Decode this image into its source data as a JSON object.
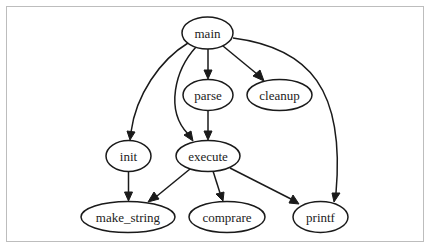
{
  "diagram": {
    "type": "directed-call-graph",
    "nodes": [
      {
        "id": "main",
        "label": "main",
        "cx": 207.5,
        "cy": 33,
        "rx": 25.5,
        "ry": 16
      },
      {
        "id": "parse",
        "label": "parse",
        "cx": 208,
        "cy": 95,
        "rx": 25,
        "ry": 15.5
      },
      {
        "id": "cleanup",
        "label": "cleanup",
        "cx": 279.5,
        "cy": 95,
        "rx": 32.5,
        "ry": 15.5
      },
      {
        "id": "init",
        "label": "init",
        "cx": 128.5,
        "cy": 156,
        "rx": 22.5,
        "ry": 15.5
      },
      {
        "id": "execute",
        "label": "execute",
        "cx": 208,
        "cy": 156,
        "rx": 32,
        "ry": 15.5
      },
      {
        "id": "make_string",
        "label": "make_string",
        "cx": 128,
        "cy": 217,
        "rx": 47,
        "ry": 15.5
      },
      {
        "id": "comprare",
        "label": "comprare",
        "cx": 227,
        "cy": 217,
        "rx": 38,
        "ry": 15.5
      },
      {
        "id": "printf",
        "label": "printf",
        "cx": 320.5,
        "cy": 217,
        "rx": 27.5,
        "ry": 15.5
      }
    ],
    "edges": [
      {
        "from": "main",
        "to": "parse"
      },
      {
        "from": "main",
        "to": "cleanup"
      },
      {
        "from": "main",
        "to": "init"
      },
      {
        "from": "main",
        "to": "execute"
      },
      {
        "from": "main",
        "to": "printf"
      },
      {
        "from": "parse",
        "to": "execute"
      },
      {
        "from": "init",
        "to": "make_string"
      },
      {
        "from": "execute",
        "to": "make_string"
      },
      {
        "from": "execute",
        "to": "comprare"
      },
      {
        "from": "execute",
        "to": "printf"
      }
    ],
    "colors": {
      "stroke": "#1a1a1a",
      "text": "#222222",
      "frame_border": "#bdbdbd",
      "background": "#ffffff"
    }
  }
}
